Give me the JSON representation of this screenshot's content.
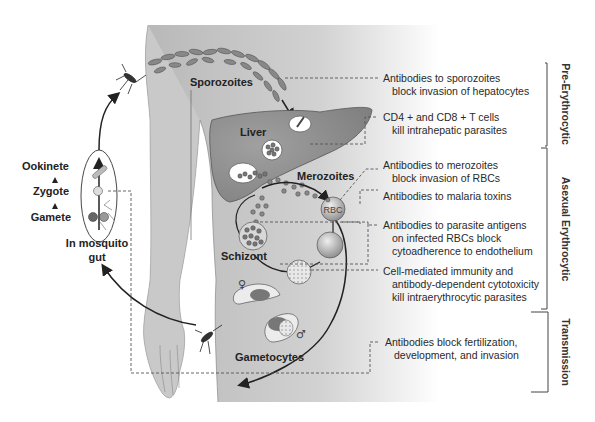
{
  "diagram": {
    "stage_labels": {
      "sporozoites": "Sporozoites",
      "liver": "Liver",
      "merozoites": "Merozoites",
      "rbc": "RBC",
      "schizont": "Schizont",
      "gametocytes": "Gametocytes",
      "female_symbol": "♀",
      "male_symbol": "♂"
    },
    "mosquito_stages": {
      "ookinete": "Ookinete",
      "zygote": "Zygote",
      "gamete": "Gamete",
      "location_line1": "In mosquito",
      "location_line2": "gut"
    },
    "immune_mechanisms": [
      {
        "line1": "Antibodies to sporozoites",
        "line2": "block invasion of hepatocytes"
      },
      {
        "line1": "CD4 + and CD8 + T cells",
        "line2": "kill intrahepatic parasites"
      },
      {
        "line1": "Antibodies to merozoites",
        "line2": "block invasion of RBCs"
      },
      {
        "line1": "Antibodies to malaria toxins"
      },
      {
        "line1": "Antibodies to parasite antigens",
        "line2": "on infected RBCs block",
        "line3": "cytoadherence to endothelium"
      },
      {
        "line1": "Cell-mediated immunity and",
        "line2": "antibody-dependent cytotoxicity",
        "line3": "kill intraerythrocytic parasites"
      },
      {
        "line1": "Antibodies block fertilization,",
        "line2": "development, and invasion"
      }
    ],
    "phases": [
      {
        "label": "Pre-Erythrocytic"
      },
      {
        "label": "Asexual Erythrocytic"
      },
      {
        "label": "Transmission"
      }
    ],
    "colors": {
      "body": "#c4c4c4",
      "liver": "#8e8e8e",
      "cell": "#7a7a7a",
      "text": "#222222",
      "line": "#555555"
    }
  }
}
